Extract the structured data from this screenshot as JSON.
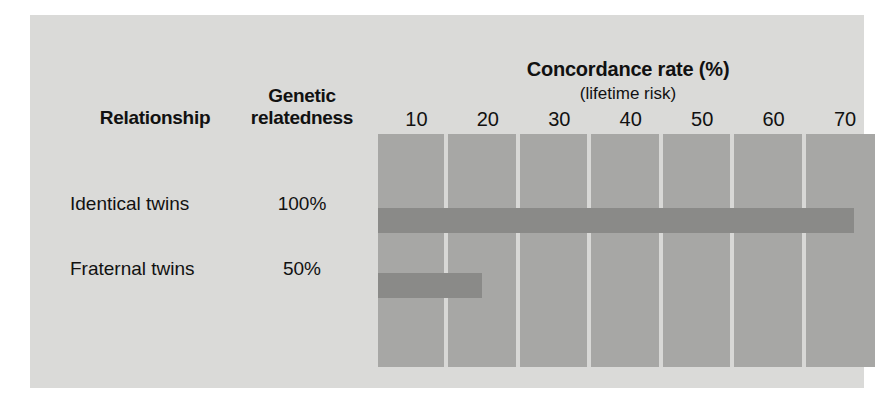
{
  "figure": {
    "panel_bg": "#dadad8",
    "plot_bg": "#a7a7a5",
    "bar_color": "#8a8a88",
    "gridline_color": "#d8d8d6"
  },
  "columns": {
    "relationship_header": "Relationship",
    "genetic_header_line1": "Genetic",
    "genetic_header_line2": "relatedness"
  },
  "rows": [
    {
      "name": "Identical twins",
      "relatedness": "100%"
    },
    {
      "name": "Fraternal twins",
      "relatedness": "50%"
    }
  ],
  "chart_data": {
    "type": "bar",
    "orientation": "horizontal",
    "title": "Concordance rate (%)",
    "subtitle": "(lifetime risk)",
    "xlabel": "",
    "ylabel": "",
    "categories": [
      "Identical twins",
      "Fraternal twins"
    ],
    "values": [
      67,
      15
    ],
    "xlim": [
      0,
      70
    ],
    "xticks": [
      10,
      20,
      30,
      40,
      50,
      60,
      70
    ],
    "xticklabels": [
      "10",
      "20",
      "30",
      "40",
      "50",
      "60",
      "70"
    ],
    "grid": true,
    "grid_axis": "x",
    "legend": false,
    "series": [
      {
        "name": "Concordance rate (%)",
        "values": [
          67,
          15
        ]
      }
    ]
  }
}
